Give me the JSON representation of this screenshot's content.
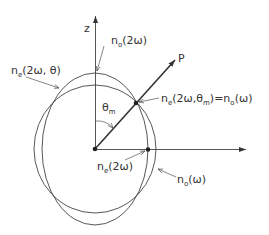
{
  "diagram": {
    "axes": {
      "vertical_label": "z"
    },
    "vector_label": "P",
    "angle_label": {
      "main": "θ",
      "sub": "m"
    },
    "labels": {
      "no_2w": {
        "main": "n",
        "sub": "o",
        "rest": "(2ω)"
      },
      "ne_2w_theta": {
        "main": "n",
        "sub": "e",
        "rest": "(2ω, θ)"
      },
      "match": {
        "main": "n",
        "sub": "e",
        "mid": "(2ω,θ",
        "midsub": "m",
        "rest": ")=n",
        "sub2": "o",
        "end": "(ω)"
      },
      "ne_2w": {
        "main": "n",
        "sub": "e",
        "rest": "(2ω)"
      },
      "no_w": {
        "main": "n",
        "sub": "o",
        "rest": "(ω)"
      }
    },
    "colors": {
      "line": "#444444",
      "text": "#333333",
      "background": "#ffffff"
    }
  }
}
